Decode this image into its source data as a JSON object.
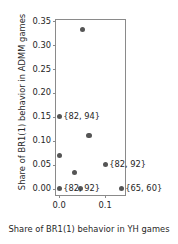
{
  "chart_data": {
    "type": "scatter",
    "title": "",
    "xlabel": "Share of BR1(1) behavior in YH games",
    "ylabel": "Share of BR1(1) behavior in ADMM games",
    "xlim": [
      -0.007,
      0.1475
    ],
    "ylim": [
      -0.0175,
      0.3525
    ],
    "grid": false,
    "legend": null,
    "xticks": [
      0.0,
      0.1
    ],
    "xticklabels": [
      "0.0",
      "0.1"
    ],
    "yticks": [
      0.0,
      0.05,
      0.1,
      0.15,
      0.2,
      0.25,
      0.3,
      0.35
    ],
    "yticklabels": [
      "0.00",
      "0.05",
      "0.10",
      "0.15",
      "0.20",
      "0.25",
      "0.30",
      "0.35"
    ],
    "marker_color": "#555555",
    "points": [
      {
        "x": 0.05,
        "y": 0.333,
        "label": ""
      },
      {
        "x": 0.065,
        "y": 0.111,
        "label": ""
      },
      {
        "x": 0.0,
        "y": 0.15,
        "label": "{82, 94}"
      },
      {
        "x": 0.0,
        "y": 0.069,
        "label": ""
      },
      {
        "x": 0.033,
        "y": 0.034,
        "label": ""
      },
      {
        "x": 0.1,
        "y": 0.05,
        "label": "{82, 92}"
      },
      {
        "x": 0.0,
        "y": 0.0,
        "label": "{82, 92}"
      },
      {
        "x": 0.047,
        "y": 0.0,
        "label": ""
      },
      {
        "x": 0.135,
        "y": 0.0,
        "label": "{65, 60}"
      }
    ],
    "annotations": [
      {
        "text": "{82, 94}",
        "x": 0.0,
        "y": 0.15
      },
      {
        "text": "{82, 92}",
        "x": 0.1,
        "y": 0.05
      },
      {
        "text": "{82, 92}",
        "x": 0.0,
        "y": 0.0
      },
      {
        "text": "{65, 60}",
        "x": 0.135,
        "y": 0.0
      }
    ]
  }
}
